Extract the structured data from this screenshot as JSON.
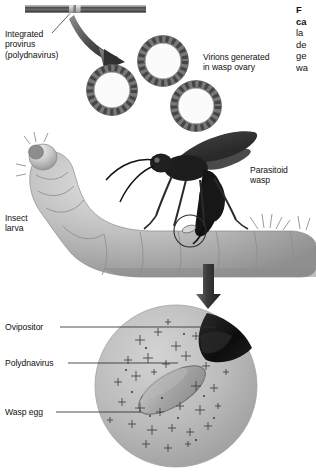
{
  "figure": {
    "title_hidden": "Polydnavirus transmission by parasitoid wasp",
    "background_color": "#ffffff",
    "ink_color": "#111111"
  },
  "labels": {
    "integrated_provirus": "Integrated\nprovirus\n(polydnavirus)",
    "virions_generated": "Virions generated\nin wasp ovary",
    "parasitoid_wasp": "Parasitoid\nwasp",
    "insect_larva": "Insect\nlarva",
    "ovipositor": "Ovipositor",
    "polydnavirus": "Polydnavirus",
    "wasp_egg": "Wasp egg"
  },
  "caption": {
    "lines": [
      "F",
      "ca",
      "la",
      "de",
      "ge",
      "wa"
    ],
    "bold_line_count": 2
  },
  "elements": {
    "dna_bar": {
      "name": "dna-bar",
      "x1": 25,
      "x2": 146,
      "y": 8
    },
    "provirus_segment": {
      "x1": 69,
      "x2": 81
    },
    "curved_arrow": {
      "from": [
        78,
        18
      ],
      "to": [
        127,
        63
      ]
    },
    "virions": [
      {
        "cx": 112,
        "cy": 90,
        "r": 22
      },
      {
        "cx": 163,
        "cy": 61,
        "r": 22
      },
      {
        "cx": 196,
        "cy": 106,
        "r": 22
      }
    ],
    "injection_circle": {
      "cx": 190,
      "cy": 231,
      "r": 16
    },
    "down_arrow": {
      "x": 208,
      "y1": 262,
      "y2": 307
    },
    "inset_circle": {
      "cx": 176,
      "cy": 386,
      "r": 81
    }
  },
  "colors": {
    "dna_bar_dark": "#5a5a5a",
    "dna_bar_light": "#cfcfcf",
    "virion_ring": "#6e6e6e",
    "larva_body": "#b9b9b9",
    "wasp_body": "#262626",
    "inset_fill": "#b5b5b5",
    "ovipositor": "#111111",
    "egg_fill": "#9a9a9a"
  }
}
